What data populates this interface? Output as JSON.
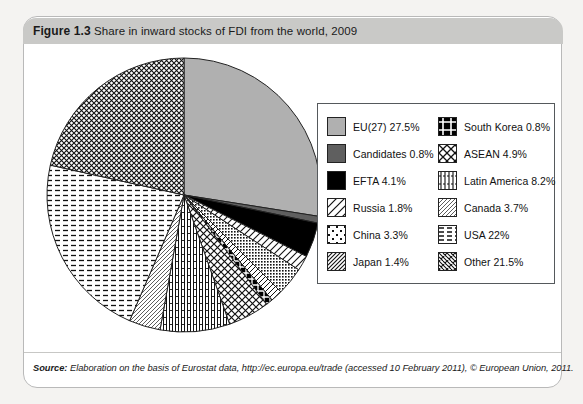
{
  "figure": {
    "label": "Figure 1.3",
    "title": "Share in inward stocks of FDI from the world, 2009"
  },
  "source": {
    "label": "Source:",
    "text": "Elaboration on the basis of Eurostat data, http://ec.europa.eu/trade (accessed 10 February 2011), © European Union, 2011."
  },
  "legend": {
    "left": [
      {
        "label": "EU(27) 27.5%",
        "pattern": "solid-light-gray",
        "swatch_name": "legend-swatch-eu27"
      },
      {
        "label": "Candidates 0.8%",
        "pattern": "solid-dark-gray",
        "swatch_name": "legend-swatch-candidates"
      },
      {
        "label": "EFTA 4.1%",
        "pattern": "solid-black",
        "swatch_name": "legend-swatch-efta"
      },
      {
        "label": "Russia 1.8%",
        "pattern": "diagonal-lines-wide",
        "swatch_name": "legend-swatch-russia"
      },
      {
        "label": "China 3.3%",
        "pattern": "fine-dot-grid",
        "swatch_name": "legend-swatch-china"
      },
      {
        "label": "Japan 1.4%",
        "pattern": "diagonal-lines-narrow",
        "swatch_name": "legend-swatch-japan"
      }
    ],
    "right": [
      {
        "label": "South Korea 0.8%",
        "pattern": "black-cross-grid",
        "swatch_name": "legend-swatch-south-korea"
      },
      {
        "label": "ASEAN 4.9%",
        "pattern": "diamond-crosshatch",
        "swatch_name": "legend-swatch-asean"
      },
      {
        "label": "Latin America 8.2%",
        "pattern": "vertical-bars-dashes",
        "swatch_name": "legend-swatch-latin-america"
      },
      {
        "label": "Canada 3.7%",
        "pattern": "fine-diagonal",
        "swatch_name": "legend-swatch-canada"
      },
      {
        "label": "USA 22%",
        "pattern": "horizontal-dashes",
        "swatch_name": "legend-swatch-usa"
      },
      {
        "label": "Other 21.5%",
        "pattern": "dense-crosshatch",
        "swatch_name": "legend-swatch-other"
      }
    ]
  },
  "chart_data": {
    "type": "pie",
    "title": "Share in inward stocks of FDI from the world, 2009",
    "unit": "percent",
    "legend_position": "right",
    "start_angle_deg": 0,
    "direction": "clockwise",
    "categories": [
      "EU(27)",
      "Candidates",
      "EFTA",
      "Russia",
      "China",
      "Japan",
      "South Korea",
      "ASEAN",
      "Latin America",
      "Canada",
      "USA",
      "Other"
    ],
    "values": [
      27.5,
      0.8,
      4.1,
      1.8,
      3.3,
      1.4,
      0.8,
      4.9,
      8.2,
      3.7,
      22.0,
      21.5
    ],
    "patterns": [
      "solid-light-gray",
      "solid-dark-gray",
      "solid-black",
      "diagonal-lines-wide",
      "fine-dot-grid",
      "diagonal-lines-narrow",
      "black-cross-grid",
      "diamond-crosshatch",
      "vertical-bars-dashes",
      "fine-diagonal",
      "horizontal-dashes",
      "dense-crosshatch"
    ],
    "total": 100.0
  },
  "colors": {
    "page_background": "#f4f3f1",
    "card_background": "#ffffff",
    "header_bar": "#c9c9c7",
    "eu27_fill": "#b0b0b0",
    "candidates_fill": "#5f5f5f",
    "efta_fill": "#000000",
    "outline": "#222222"
  }
}
